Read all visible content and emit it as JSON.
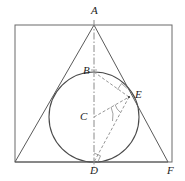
{
  "figure": {
    "canvas": {
      "width": 185,
      "height": 181
    },
    "colors": {
      "stroke": "#555555",
      "circle_stroke": "#444444",
      "dashed_stroke": "#777777",
      "axis_stroke": "#888888",
      "label_text": "#1c1c1c",
      "background": "#ffffff"
    },
    "points": {
      "A": {
        "label": "A",
        "x": 94,
        "y": 25,
        "label_x": 91,
        "label_y": 6
      },
      "B": {
        "label": "B",
        "x": 94,
        "y": 72,
        "label_x": 83,
        "label_y": 70
      },
      "C": {
        "label": "C",
        "x": 94,
        "y": 117,
        "label_x": 81,
        "label_y": 112
      },
      "D": {
        "label": "D",
        "x": 94,
        "y": 162,
        "label_x": 90,
        "label_y": 166
      },
      "E": {
        "label": "E",
        "x": 129,
        "y": 97,
        "label_x": 135,
        "label_y": 92
      },
      "F": {
        "label": "F",
        "x": 168,
        "y": 162,
        "label_x": 168,
        "label_y": 166
      }
    },
    "rectangle": {
      "x": 15,
      "y": 25,
      "width": 157,
      "height": 137
    },
    "circle": {
      "cx": 94,
      "cy": 117,
      "r": 45
    },
    "triangle": {
      "apex": {
        "x": 94,
        "y": 25
      },
      "bottom_left": {
        "x": 15,
        "y": 162
      },
      "bottom_right": {
        "x": 168,
        "y": 162
      }
    },
    "segments": [
      {
        "name": "triangle-side-left",
        "style": "solid",
        "x1": 94,
        "y1": 25,
        "x2": 15,
        "y2": 162
      },
      {
        "name": "triangle-side-right",
        "style": "solid",
        "x1": 94,
        "y1": 25,
        "x2": 168,
        "y2": 162
      },
      {
        "name": "triangle-base",
        "style": "solid",
        "x1": 15,
        "y1": 162,
        "x2": 168,
        "y2": 162
      },
      {
        "name": "axis-A-D",
        "style": "dashdot",
        "x1": 94,
        "y1": 20,
        "x2": 94,
        "y2": 170
      },
      {
        "name": "chord-B-E",
        "style": "dashed",
        "x1": 94,
        "y1": 72,
        "x2": 129,
        "y2": 97
      },
      {
        "name": "radius-C-E",
        "style": "dashed",
        "x1": 94,
        "y1": 117,
        "x2": 129,
        "y2": 97
      },
      {
        "name": "chord-E-D",
        "style": "dashed",
        "x1": 129,
        "y1": 97,
        "x2": 94,
        "y2": 162
      }
    ],
    "markers": [
      {
        "name": "right-angle-at-D",
        "type": "right-angle"
      },
      {
        "name": "right-angle-at-E-on-BE",
        "type": "right-angle"
      },
      {
        "name": "angle-arc-at-C",
        "type": "arc"
      },
      {
        "name": "angle-arc-at-E",
        "type": "arc"
      },
      {
        "name": "tick-at-B",
        "type": "tick"
      }
    ]
  }
}
